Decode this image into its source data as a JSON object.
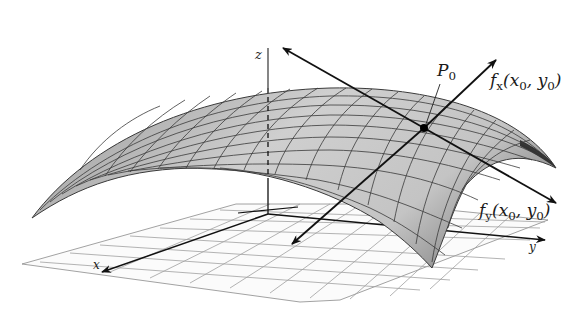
{
  "diagram": {
    "type": "3d-surface-tangent-lines",
    "labels": {
      "z_axis": "z",
      "x_axis": "x",
      "y_axis": "y",
      "point": "P",
      "point_sub": "0",
      "fx_name": "f",
      "fx_sub": "x",
      "fx_args": "(x",
      "fx_args_sub1": "0",
      "fx_args_mid": ", y",
      "fx_args_sub2": "0",
      "fx_args_end": ")",
      "fy_name": "f",
      "fy_sub": "y",
      "fy_args": "(x",
      "fy_args_sub1": "0",
      "fy_args_mid": ", y",
      "fy_args_sub2": "0",
      "fy_args_end": ")"
    },
    "colors": {
      "background": "#ffffff",
      "surface_light": "#d9d9d9",
      "surface_mid": "#b5b5b5",
      "surface_dark": "#555555",
      "mesh_line": "#3a3a3a",
      "grid_line": "#9a9a9a",
      "axis": "#111111"
    }
  }
}
